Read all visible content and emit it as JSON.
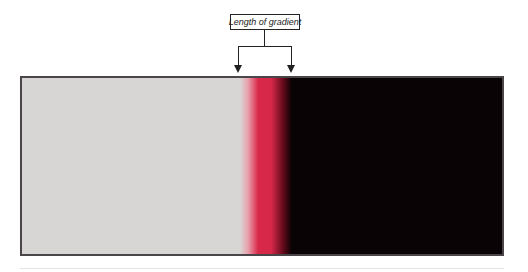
{
  "annotation": {
    "label": "Length of gradient",
    "arrows": [
      "gradient-start",
      "gradient-end"
    ]
  },
  "gradient_panel": {
    "colors": {
      "start": "#d8d6d4",
      "mid_pink": "#e8a0ac",
      "red": "#d8284a",
      "dark_red": "#5a0818",
      "end": "#0a0305",
      "border": "#4a4548"
    },
    "gradient_start_x": 240,
    "gradient_end_x": 292
  }
}
